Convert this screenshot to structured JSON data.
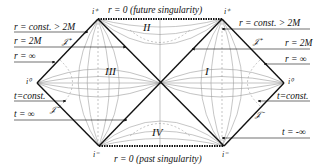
{
  "diagram": {
    "top_label": "r = 0 (future singularity)",
    "bottom_label": "r = 0 (past singularity)",
    "regions": {
      "I": "I",
      "II": "II",
      "III": "III",
      "IV": "IV"
    },
    "points": {
      "future_timelike_left": "i⁺",
      "future_timelike_right": "i⁺",
      "past_timelike_left": "i⁻",
      "past_timelike_right": "i⁻",
      "spatial_left": "i⁰",
      "spatial_right": "i⁰",
      "scri_plus_left": "𝒥⁺",
      "scri_plus_right": "𝒥⁺",
      "scri_minus_left": "𝒥⁻",
      "scri_minus_right": "𝒥⁻"
    },
    "left_labels": {
      "r_const": "r = const. > 2M",
      "r_2m": "r = 2M",
      "r_inf": "r = ∞",
      "t_const": "t=const.",
      "t_inf": "t = ∞"
    },
    "right_labels": {
      "r_const": "r = const. > 2M",
      "r_2m": "r = 2M",
      "r_inf": "r = ∞",
      "t_const": "t=const.",
      "t_minus_inf": "t = -∞"
    },
    "colors": {
      "boundary": "#111111",
      "curves": "#9a9a9a",
      "dashed": "#8a8a8a"
    }
  }
}
